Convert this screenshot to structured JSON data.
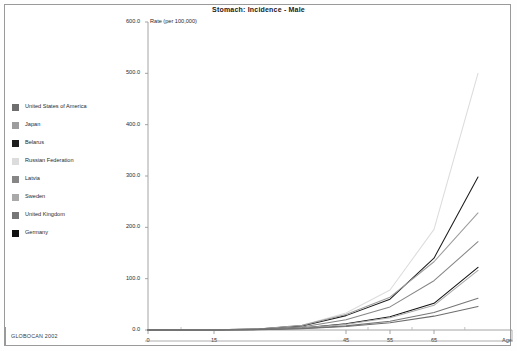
{
  "window": {
    "title": "Stomach: Incidence - Male",
    "background": "#ffffff",
    "frame_color": "#9a9a9a"
  },
  "footer": {
    "source": "GLOBOCAN 2002"
  },
  "legend": {
    "position": "left",
    "items": [
      {
        "label": "United States of America",
        "color": "#6e6e6e"
      },
      {
        "label": "Japan",
        "color": "#9d9d9d"
      },
      {
        "label": "Belarus",
        "color": "#1d1d1d"
      },
      {
        "label": "Russian Federation",
        "color": "#dcdcdc"
      },
      {
        "label": "Latvia",
        "color": "#868686"
      },
      {
        "label": "Sweden",
        "color": "#a9a9a9"
      },
      {
        "label": "United Kingdom",
        "color": "#767676"
      },
      {
        "label": "Germany",
        "color": "#111111"
      }
    ]
  },
  "chart_data": {
    "type": "line",
    "title": "Stomach: Incidence - Male",
    "xlabel": "Age",
    "ylabel": "Rate (per 100,000)",
    "grid": false,
    "legend_position": "left",
    "x": [
      0,
      15,
      25,
      35,
      45,
      55,
      65,
      75
    ],
    "xlim": [
      0,
      80
    ],
    "ylim": [
      0,
      600
    ],
    "xticks": [
      "0",
      "15",
      "45",
      "55",
      "65"
    ],
    "xtick_values": [
      0,
      15,
      45,
      55,
      65
    ],
    "yticks": [
      "0.0",
      "100.0",
      "200.0",
      "300.0",
      "400.0",
      "500.0",
      "600.0"
    ],
    "ytick_values": [
      0,
      100,
      200,
      300,
      400,
      500,
      600
    ],
    "series": [
      {
        "name": "Russian Federation",
        "color": "#dcdcdc",
        "values": [
          0.2,
          0.6,
          2,
          9,
          33,
          78,
          196,
          500
        ]
      },
      {
        "name": "Belarus",
        "color": "#1d1d1d",
        "values": [
          0.2,
          0.5,
          2,
          8,
          28,
          60,
          140,
          298
        ]
      },
      {
        "name": "Japan",
        "color": "#9d9d9d",
        "values": [
          0.2,
          0.5,
          2,
          9,
          30,
          64,
          133,
          228
        ]
      },
      {
        "name": "Latvia",
        "color": "#868686",
        "values": [
          0.2,
          0.4,
          1.5,
          6,
          20,
          45,
          96,
          172
        ]
      },
      {
        "name": "Germany",
        "color": "#111111",
        "values": [
          0.1,
          0.3,
          1,
          4,
          12,
          26,
          52,
          122
        ]
      },
      {
        "name": "Sweden",
        "color": "#a9a9a9",
        "values": [
          0.1,
          0.3,
          1,
          4,
          11,
          24,
          48,
          116
        ]
      },
      {
        "name": "United Kingdom",
        "color": "#767676",
        "values": [
          0.1,
          0.2,
          0.8,
          3,
          8,
          17,
          34,
          62
        ]
      },
      {
        "name": "United States of America",
        "color": "#6e6e6e",
        "values": [
          0.1,
          0.2,
          0.7,
          2.5,
          7,
          14,
          27,
          46
        ]
      }
    ]
  }
}
